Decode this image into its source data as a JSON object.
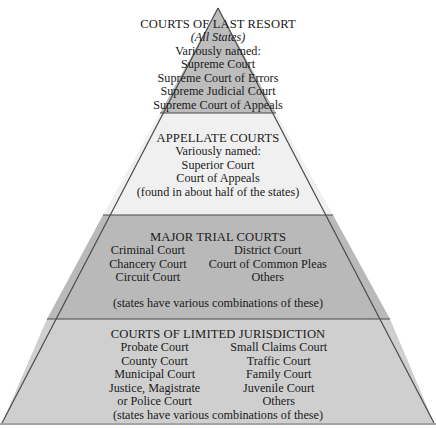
{
  "colors": {
    "tier1": "#bdbdbd",
    "tier2": "#f0f0f0",
    "tier3": "#b9b9b9",
    "tier4": "#cfcfcf",
    "stroke": "#4a4a4a"
  },
  "tiers": [
    {
      "heading": "COURTS OF LAST RESORT",
      "subheading": "(All States)",
      "lines": [
        "Variously named:",
        "Supreme Court",
        "Supreme Court of Errors",
        "Supreme Judicial Court",
        "Supreme Court of Appeals"
      ]
    },
    {
      "heading": "APPELLATE COURTS",
      "lines": [
        "Variously named:",
        "Superior Court",
        "Court of Appeals",
        "(found in about half of the states)"
      ]
    },
    {
      "heading": "MAJOR TRIAL COURTS",
      "left": [
        "Criminal Court",
        "Chancery Court",
        "Circuit Court"
      ],
      "right": [
        "District Court",
        "Court of Common Pleas",
        "Others"
      ],
      "note": "(states have various combinations of these)"
    },
    {
      "heading": "COURTS OF LIMITED JURISDICTION",
      "left": [
        "Probate Court",
        "County Court",
        "Municipal Court",
        "Justice, Magistrate",
        "or Police Court"
      ],
      "right": [
        "Small Claims Court",
        "Traffic Court",
        "Family Court",
        "Juvenile Court",
        "Others"
      ],
      "note": "(states have various combinations of these)"
    }
  ]
}
